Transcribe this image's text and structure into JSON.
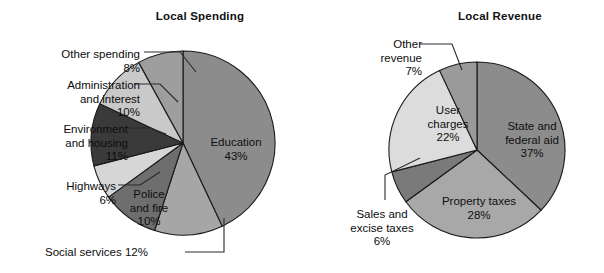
{
  "figure": {
    "background": "#ffffff",
    "outline_color": "#1a1a1a"
  },
  "chart_data": [
    {
      "type": "pie",
      "name": "local-spending",
      "title": "Local Spending",
      "xlabel": "",
      "ylabel": "",
      "legend_position": "none",
      "grid": false,
      "units": "percent",
      "total": 100,
      "categories": [
        "Education",
        "Social services",
        "Police and fire",
        "Highways",
        "Environment and housing",
        "Administration and interest",
        "Other spending"
      ],
      "values": [
        43,
        12,
        10,
        6,
        11,
        10,
        8
      ],
      "value_labels": [
        "43%",
        "12%",
        "10%",
        "6%",
        "11%",
        "10%",
        "8%"
      ],
      "colors": [
        "#8c8c8c",
        "#a6a6a6",
        "#6e6e6e",
        "#d6d6d6",
        "#3a3a3a",
        "#c9c9c9",
        "#9e9e9e"
      ],
      "slices": [
        {
          "label": "Education",
          "value": 43,
          "value_label": "43%",
          "color": "#8c8c8c",
          "label_placement": "inside"
        },
        {
          "label": "Social services",
          "value": 12,
          "value_label": "12%",
          "color": "#a6a6a6",
          "label_placement": "outside-bottom-left"
        },
        {
          "label": "Police and fire",
          "value": 10,
          "value_label": "10%",
          "color": "#6e6e6e",
          "label_placement": "inside"
        },
        {
          "label": "Highways",
          "value": 6,
          "value_label": "6%",
          "color": "#d6d6d6",
          "label_placement": "outside-left"
        },
        {
          "label": "Environment and housing",
          "value": 11,
          "value_label": "11%",
          "color": "#3a3a3a",
          "label_placement": "outside-left"
        },
        {
          "label": "Administration and interest",
          "value": 10,
          "value_label": "10%",
          "color": "#c9c9c9",
          "label_placement": "outside-left"
        },
        {
          "label": "Other spending",
          "value": 8,
          "value_label": "8%",
          "color": "#9e9e9e",
          "label_placement": "outside-top-left"
        }
      ],
      "callouts": {
        "education": "Education\n43%",
        "police_and_fire": "Police\nand fire\n10%",
        "social_services": "Social services 12%",
        "highways": "Highways\n6%",
        "environment": "Environment\nand housing\n11%",
        "administration": "Administration\nand interest\n10%",
        "other_spending": "Other spending\n8%"
      }
    },
    {
      "type": "pie",
      "name": "local-revenue",
      "title": "Local Revenue",
      "xlabel": "",
      "ylabel": "",
      "legend_position": "none",
      "grid": false,
      "units": "percent",
      "total": 100,
      "categories": [
        "State and federal aid",
        "Property taxes",
        "Sales and excise taxes",
        "User charges",
        "Other revenue"
      ],
      "values": [
        37,
        28,
        6,
        22,
        7
      ],
      "value_labels": [
        "37%",
        "28%",
        "6%",
        "22%",
        "7%"
      ],
      "colors": [
        "#8c8c8c",
        "#a8a8a8",
        "#7a7a7a",
        "#dcdcdc",
        "#9a9a9a"
      ],
      "slices": [
        {
          "label": "State and federal aid",
          "value": 37,
          "value_label": "37%",
          "color": "#8c8c8c",
          "label_placement": "inside"
        },
        {
          "label": "Property taxes",
          "value": 28,
          "value_label": "28%",
          "color": "#a8a8a8",
          "label_placement": "inside"
        },
        {
          "label": "Sales and excise taxes",
          "value": 6,
          "value_label": "6%",
          "color": "#7a7a7a",
          "label_placement": "outside-left"
        },
        {
          "label": "User charges",
          "value": 22,
          "value_label": "22%",
          "color": "#dcdcdc",
          "label_placement": "inside"
        },
        {
          "label": "Other revenue",
          "value": 7,
          "value_label": "7%",
          "color": "#9a9a9a",
          "label_placement": "outside-top-left"
        }
      ],
      "callouts": {
        "state_and_federal_aid": "State and\nfederal aid\n37%",
        "property_taxes": "Property taxes\n28%",
        "sales_and_excise_taxes": "Sales and\nexcise taxes\n6%",
        "user_charges": "User\ncharges\n22%",
        "other_revenue": "Other\nrevenue\n7%"
      }
    }
  ]
}
